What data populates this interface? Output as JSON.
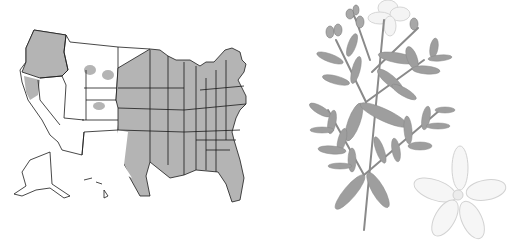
{
  "figure": {
    "map": {
      "subject": "united-states-distribution-map",
      "fill_color": "#b4b4b4",
      "empty_color": "#ffffff",
      "border_color": "#1a1a1a"
    },
    "illustration": {
      "subject": "flowering-plant-illustration",
      "leaf_color": "#9e9e9e",
      "stem_color": "#8a8a8a",
      "flower_outline_color": "#cfcfcf",
      "flower_fill_color": "#f4f4f4"
    }
  }
}
